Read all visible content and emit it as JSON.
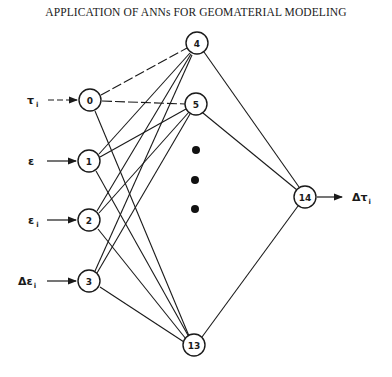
{
  "title": "APPLICATION OF ANNs FOR GEOMATERIAL MODELING",
  "diagram": {
    "type": "feedforward neural network",
    "inputs": [
      {
        "label": "τ",
        "sub": "i",
        "node": "0"
      },
      {
        "label": "ε",
        "sub": "",
        "node": "1"
      },
      {
        "label": "ε",
        "sub": "i",
        "node": "2"
      },
      {
        "label": "Δε",
        "sub": "i",
        "node": "3"
      }
    ],
    "input_nodes": [
      "0",
      "1",
      "2",
      "3"
    ],
    "hidden_nodes": [
      "4",
      "5",
      "13"
    ],
    "hidden_ellipsis": "•••",
    "output_nodes": [
      "14"
    ],
    "output": {
      "label": "Δτ",
      "sub": "i"
    }
  }
}
